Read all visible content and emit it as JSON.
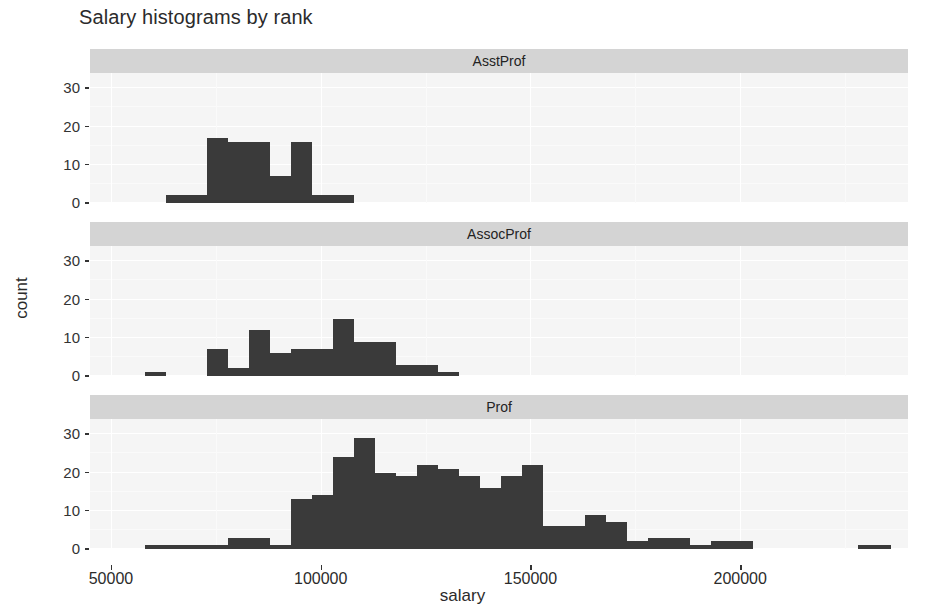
{
  "title": "Salary histograms by rank",
  "axes": {
    "xlabel": "salary",
    "ylabel": "count",
    "x_ticks": [
      "50000",
      "100000",
      "150000",
      "200000"
    ],
    "y_ticks": [
      "0",
      "10",
      "20",
      "30"
    ]
  },
  "facets": [
    {
      "label": "AsstProf"
    },
    {
      "label": "AssocProf"
    },
    {
      "label": "Prof"
    }
  ],
  "colors": {
    "bar": "#3a3a3a",
    "panel_background": "#f5f5f5",
    "strip_background": "#d4d4d4",
    "grid": "#ffffff",
    "text": "#2b2b2b"
  },
  "chart_data": {
    "type": "bar",
    "subtype": "histogram-faceted",
    "title": "Salary histograms by rank",
    "xlabel": "salary",
    "ylabel": "count",
    "xlim": [
      45000,
      240000
    ],
    "ylim": [
      0,
      34
    ],
    "x_ticks": [
      50000,
      100000,
      150000,
      200000
    ],
    "y_ticks": [
      0,
      10,
      20,
      30
    ],
    "grid": true,
    "legend": "none",
    "facet_variable": "rank",
    "bin_width": 5000,
    "panels": [
      {
        "facet": "AsstProf",
        "bins": [
          {
            "x0": 63000,
            "x1": 68000,
            "count": 2
          },
          {
            "x0": 68000,
            "x1": 73000,
            "count": 2
          },
          {
            "x0": 73000,
            "x1": 78000,
            "count": 17
          },
          {
            "x0": 78000,
            "x1": 83000,
            "count": 16
          },
          {
            "x0": 83000,
            "x1": 88000,
            "count": 16
          },
          {
            "x0": 88000,
            "x1": 93000,
            "count": 7
          },
          {
            "x0": 93000,
            "x1": 98000,
            "count": 16
          },
          {
            "x0": 98000,
            "x1": 103000,
            "count": 2
          },
          {
            "x0": 103000,
            "x1": 108000,
            "count": 2
          }
        ]
      },
      {
        "facet": "AssocProf",
        "bins": [
          {
            "x0": 58000,
            "x1": 63000,
            "count": 1
          },
          {
            "x0": 73000,
            "x1": 78000,
            "count": 7
          },
          {
            "x0": 78000,
            "x1": 83000,
            "count": 2
          },
          {
            "x0": 83000,
            "x1": 88000,
            "count": 12
          },
          {
            "x0": 88000,
            "x1": 93000,
            "count": 6
          },
          {
            "x0": 93000,
            "x1": 98000,
            "count": 7
          },
          {
            "x0": 98000,
            "x1": 103000,
            "count": 7
          },
          {
            "x0": 103000,
            "x1": 108000,
            "count": 15
          },
          {
            "x0": 108000,
            "x1": 113000,
            "count": 9
          },
          {
            "x0": 113000,
            "x1": 118000,
            "count": 9
          },
          {
            "x0": 118000,
            "x1": 123000,
            "count": 3
          },
          {
            "x0": 123000,
            "x1": 128000,
            "count": 3
          },
          {
            "x0": 128000,
            "x1": 133000,
            "count": 1
          }
        ]
      },
      {
        "facet": "Prof",
        "bins": [
          {
            "x0": 58000,
            "x1": 63000,
            "count": 1
          },
          {
            "x0": 63000,
            "x1": 68000,
            "count": 1
          },
          {
            "x0": 68000,
            "x1": 73000,
            "count": 1
          },
          {
            "x0": 73000,
            "x1": 78000,
            "count": 1
          },
          {
            "x0": 78000,
            "x1": 83000,
            "count": 3
          },
          {
            "x0": 83000,
            "x1": 88000,
            "count": 3
          },
          {
            "x0": 88000,
            "x1": 93000,
            "count": 1
          },
          {
            "x0": 93000,
            "x1": 98000,
            "count": 13
          },
          {
            "x0": 98000,
            "x1": 103000,
            "count": 14
          },
          {
            "x0": 103000,
            "x1": 108000,
            "count": 24
          },
          {
            "x0": 108000,
            "x1": 113000,
            "count": 29
          },
          {
            "x0": 113000,
            "x1": 118000,
            "count": 20
          },
          {
            "x0": 118000,
            "x1": 123000,
            "count": 19
          },
          {
            "x0": 123000,
            "x1": 128000,
            "count": 22
          },
          {
            "x0": 128000,
            "x1": 133000,
            "count": 21
          },
          {
            "x0": 133000,
            "x1": 138000,
            "count": 19
          },
          {
            "x0": 138000,
            "x1": 143000,
            "count": 16
          },
          {
            "x0": 143000,
            "x1": 148000,
            "count": 19
          },
          {
            "x0": 148000,
            "x1": 153000,
            "count": 22
          },
          {
            "x0": 153000,
            "x1": 158000,
            "count": 6
          },
          {
            "x0": 158000,
            "x1": 163000,
            "count": 6
          },
          {
            "x0": 163000,
            "x1": 168000,
            "count": 9
          },
          {
            "x0": 168000,
            "x1": 173000,
            "count": 7
          },
          {
            "x0": 173000,
            "x1": 178000,
            "count": 2
          },
          {
            "x0": 178000,
            "x1": 188000,
            "count": 3
          },
          {
            "x0": 188000,
            "x1": 193000,
            "count": 1
          },
          {
            "x0": 193000,
            "x1": 203000,
            "count": 2
          },
          {
            "x0": 228000,
            "x1": 236000,
            "count": 1
          }
        ]
      }
    ]
  }
}
